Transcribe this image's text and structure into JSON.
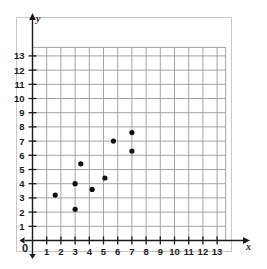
{
  "figure": {
    "origin_label": "0",
    "x_axis_name": "x",
    "y_axis_name": "y"
  },
  "chart_data": {
    "type": "scatter",
    "title": "",
    "xlabel": "x",
    "ylabel": "y",
    "xlim": [
      0,
      13.6
    ],
    "ylim": [
      0,
      13.6
    ],
    "grid": true,
    "legend": "none",
    "x_ticks": [
      0,
      1,
      2,
      3,
      4,
      5,
      6,
      7,
      8,
      9,
      10,
      11,
      12,
      13
    ],
    "y_ticks": [
      0,
      1,
      2,
      3,
      4,
      5,
      6,
      7,
      8,
      9,
      10,
      11,
      12,
      13
    ],
    "x_tick_labels": [
      "0",
      "1",
      "2",
      "3",
      "4",
      "5",
      "6",
      "7",
      "8",
      "9",
      "10",
      "11",
      "12",
      "13"
    ],
    "y_tick_labels": [
      "0",
      "1",
      "2",
      "3",
      "4",
      "5",
      "6",
      "7",
      "8",
      "9",
      "10",
      "11",
      "12",
      "13"
    ],
    "point_color": "#111111",
    "point_radius": 2.6,
    "points": [
      {
        "x": 1.6,
        "y": 3.2
      },
      {
        "x": 3.0,
        "y": 2.2
      },
      {
        "x": 3.0,
        "y": 4.0
      },
      {
        "x": 3.4,
        "y": 5.4
      },
      {
        "x": 4.2,
        "y": 3.6
      },
      {
        "x": 5.1,
        "y": 4.4
      },
      {
        "x": 5.7,
        "y": 7.0
      },
      {
        "x": 7.0,
        "y": 6.3
      },
      {
        "x": 7.0,
        "y": 7.6
      }
    ],
    "series": [
      {
        "name": "data",
        "x": [
          1.6,
          3.0,
          3.0,
          3.4,
          4.2,
          5.1,
          5.7,
          7.0,
          7.0
        ],
        "values": [
          3.2,
          2.2,
          4.0,
          5.4,
          3.6,
          4.4,
          7.0,
          6.3,
          7.6
        ]
      }
    ]
  },
  "colors": {
    "grid": "#9a9a9a",
    "axis": "#1a1a1a",
    "frame": "#c8c8c8",
    "point": "#111111"
  }
}
